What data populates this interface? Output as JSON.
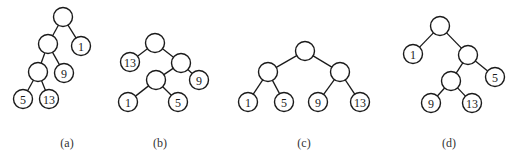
{
  "figure": {
    "node_radius": 9.5,
    "colors": {
      "stroke": "#1a1a1a",
      "fill": "#ffffff",
      "caption": "#333333"
    },
    "trees": [
      {
        "id": "a",
        "caption": "(a)",
        "caption_pos": [
          67,
          147
        ],
        "nodes": [
          {
            "id": "a0",
            "label": "",
            "x": 63,
            "y": 17
          },
          {
            "id": "a1",
            "label": "",
            "x": 48,
            "y": 44
          },
          {
            "id": "a2",
            "label": "1",
            "x": 81,
            "y": 46
          },
          {
            "id": "a3",
            "label": "",
            "x": 38,
            "y": 72
          },
          {
            "id": "a4",
            "label": "9",
            "x": 64,
            "y": 73
          },
          {
            "id": "a5",
            "label": "5",
            "x": 23,
            "y": 99
          },
          {
            "id": "a6",
            "label": "13",
            "x": 49,
            "y": 99
          }
        ],
        "edges": [
          [
            "a0",
            "a1"
          ],
          [
            "a0",
            "a2"
          ],
          [
            "a1",
            "a3"
          ],
          [
            "a1",
            "a4"
          ],
          [
            "a3",
            "a5"
          ],
          [
            "a3",
            "a6"
          ]
        ]
      },
      {
        "id": "b",
        "caption": "(b)",
        "caption_pos": [
          160,
          147
        ],
        "nodes": [
          {
            "id": "b0",
            "label": "",
            "x": 155,
            "y": 43
          },
          {
            "id": "b1",
            "label": "13",
            "x": 130,
            "y": 62
          },
          {
            "id": "b2",
            "label": "",
            "x": 181,
            "y": 63
          },
          {
            "id": "b3",
            "label": "",
            "x": 156,
            "y": 80
          },
          {
            "id": "b4",
            "label": "9",
            "x": 199,
            "y": 80
          },
          {
            "id": "b5",
            "label": "1",
            "x": 128,
            "y": 102
          },
          {
            "id": "b6",
            "label": "5",
            "x": 178,
            "y": 102
          }
        ],
        "edges": [
          [
            "b0",
            "b1"
          ],
          [
            "b0",
            "b2"
          ],
          [
            "b2",
            "b3"
          ],
          [
            "b2",
            "b4"
          ],
          [
            "b3",
            "b5"
          ],
          [
            "b3",
            "b6"
          ]
        ]
      },
      {
        "id": "c",
        "caption": "(c)",
        "caption_pos": [
          304,
          147
        ],
        "nodes": [
          {
            "id": "c0",
            "label": "",
            "x": 305,
            "y": 51
          },
          {
            "id": "c1",
            "label": "",
            "x": 268,
            "y": 72
          },
          {
            "id": "c2",
            "label": "",
            "x": 340,
            "y": 72
          },
          {
            "id": "c3",
            "label": "1",
            "x": 248,
            "y": 102
          },
          {
            "id": "c4",
            "label": "5",
            "x": 284,
            "y": 102
          },
          {
            "id": "c5",
            "label": "9",
            "x": 318,
            "y": 102
          },
          {
            "id": "c6",
            "label": "13",
            "x": 360,
            "y": 102
          }
        ],
        "edges": [
          [
            "c0",
            "c1"
          ],
          [
            "c0",
            "c2"
          ],
          [
            "c1",
            "c3"
          ],
          [
            "c1",
            "c4"
          ],
          [
            "c2",
            "c5"
          ],
          [
            "c2",
            "c6"
          ]
        ]
      },
      {
        "id": "d",
        "caption": "(d)",
        "caption_pos": [
          449,
          147
        ],
        "nodes": [
          {
            "id": "d0",
            "label": "",
            "x": 440,
            "y": 26
          },
          {
            "id": "d1",
            "label": "1",
            "x": 413,
            "y": 54
          },
          {
            "id": "d2",
            "label": "",
            "x": 468,
            "y": 55
          },
          {
            "id": "d3",
            "label": "",
            "x": 451,
            "y": 81
          },
          {
            "id": "d4",
            "label": "5",
            "x": 495,
            "y": 77
          },
          {
            "id": "d5",
            "label": "9",
            "x": 431,
            "y": 103
          },
          {
            "id": "d6",
            "label": "13",
            "x": 472,
            "y": 103
          }
        ],
        "edges": [
          [
            "d0",
            "d1"
          ],
          [
            "d0",
            "d2"
          ],
          [
            "d2",
            "d3"
          ],
          [
            "d2",
            "d4"
          ],
          [
            "d3",
            "d5"
          ],
          [
            "d3",
            "d6"
          ]
        ]
      }
    ]
  }
}
